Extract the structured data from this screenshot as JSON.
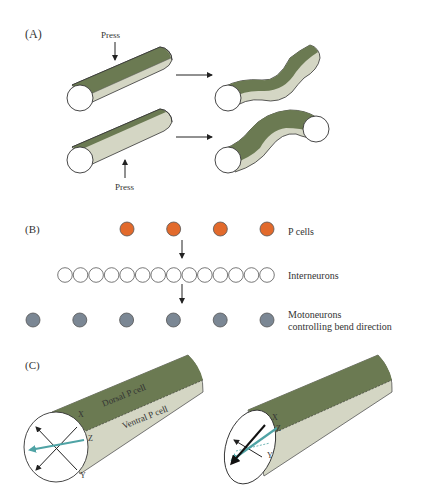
{
  "panels": {
    "a": {
      "label": "(A)",
      "press_top": "Press",
      "press_bottom": "Press"
    },
    "b": {
      "label": "(B)",
      "p_cells_label": "P cells",
      "interneurons_label": "Interneurons",
      "motoneurons_label_line1": "Motoneurons",
      "motoneurons_label_line2": "controlling bend direction",
      "p_cell_count": 4,
      "interneuron_count": 14,
      "motoneuron_count": 6
    },
    "c": {
      "label": "(C)",
      "dorsal_label": "Dorsal P cell",
      "ventral_label": "Ventral P cell",
      "axis_x": "X",
      "axis_y": "Y",
      "axis_z": "Z"
    }
  },
  "colors": {
    "dorsal_green": "#6b7a52",
    "ventral_light": "#d4d6c4",
    "p_cell_orange": "#e26a2c",
    "motoneuron_gray": "#7b8794",
    "teal_arrow": "#4fa3a5",
    "outline": "#333333"
  }
}
